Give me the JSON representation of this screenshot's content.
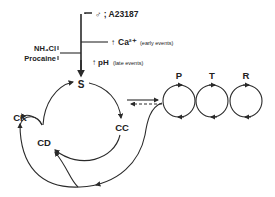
{
  "diagram": {
    "stimulus": {
      "agents": "♂ ; A23187",
      "inhibitors": [
        "NH₄Cl",
        "Procaine"
      ],
      "effects": [
        {
          "symbol": "↑",
          "text": "Ca²⁺",
          "note": "(early events)"
        },
        {
          "symbol": "↑",
          "text": "pH",
          "note": "(late events)"
        }
      ]
    },
    "cycle_nodes": {
      "s": "S",
      "cc": "CC",
      "cd": "CD",
      "ck": "CK"
    },
    "loops": [
      {
        "label": "P"
      },
      {
        "label": "T"
      },
      {
        "label": "R"
      }
    ],
    "colors": {
      "line": "#2a2a2a",
      "background": "#ffffff"
    }
  }
}
